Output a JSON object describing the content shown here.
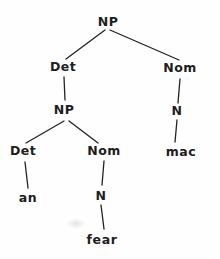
{
  "colors": {
    "ink": "#1d1d1d",
    "background": "#fefefe"
  },
  "diagram": {
    "type": "syntax-tree",
    "nodes": [
      {
        "id": "np-root",
        "label": "NP",
        "terminal": false
      },
      {
        "id": "det-upper",
        "label": "Det",
        "terminal": false
      },
      {
        "id": "nom-right",
        "label": "Nom",
        "terminal": false
      },
      {
        "id": "np-inner",
        "label": "NP",
        "terminal": false
      },
      {
        "id": "n-right",
        "label": "N",
        "terminal": false
      },
      {
        "id": "mac",
        "label": "mac",
        "terminal": true
      },
      {
        "id": "det-lower",
        "label": "Det",
        "terminal": false
      },
      {
        "id": "nom-lower",
        "label": "Nom",
        "terminal": false
      },
      {
        "id": "an",
        "label": "an",
        "terminal": true
      },
      {
        "id": "n-lower",
        "label": "N",
        "terminal": false
      },
      {
        "id": "fear",
        "label": "fear",
        "terminal": true
      }
    ],
    "edges": [
      {
        "from": "np-root",
        "to": "det-upper"
      },
      {
        "from": "np-root",
        "to": "nom-right"
      },
      {
        "from": "det-upper",
        "to": "np-inner"
      },
      {
        "from": "np-inner",
        "to": "det-lower"
      },
      {
        "from": "np-inner",
        "to": "nom-lower"
      },
      {
        "from": "det-lower",
        "to": "an"
      },
      {
        "from": "nom-lower",
        "to": "n-lower"
      },
      {
        "from": "n-lower",
        "to": "fear"
      },
      {
        "from": "nom-right",
        "to": "n-right"
      },
      {
        "from": "n-right",
        "to": "mac"
      }
    ]
  }
}
